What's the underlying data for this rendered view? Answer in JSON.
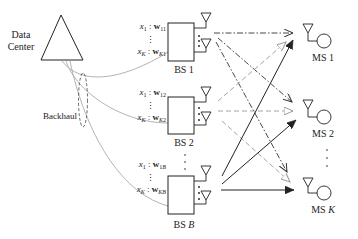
{
  "diagram": {
    "type": "system-model",
    "data_center": {
      "label_line1": "Data",
      "label_line2": "Center"
    },
    "backhaul_label": "Backhaul",
    "base_stations": [
      {
        "label": "BS 1",
        "label_prefix": "BS ",
        "label_index": "1",
        "first_stream": {
          "x": "x",
          "x_sub": "1",
          "w": "w",
          "w_sub": "11"
        },
        "last_stream": {
          "x": "x",
          "x_sub": "K",
          "w": "w",
          "w_sub": "K1"
        }
      },
      {
        "label": "BS 2",
        "label_prefix": "BS ",
        "label_index": "2",
        "first_stream": {
          "x": "x",
          "x_sub": "1",
          "w": "w",
          "w_sub": "12"
        },
        "last_stream": {
          "x": "x",
          "x_sub": "K",
          "w": "w",
          "w_sub": "K2"
        }
      },
      {
        "label": "BS B",
        "label_prefix": "BS ",
        "label_index": "B",
        "first_stream": {
          "x": "x",
          "x_sub": "1",
          "w": "w",
          "w_sub": "1B"
        },
        "last_stream": {
          "x": "x",
          "x_sub": "K",
          "w": "w",
          "w_sub": "KB"
        }
      }
    ],
    "mobile_stations": [
      {
        "label": "MS 1",
        "prefix": "MS ",
        "index": "1"
      },
      {
        "label": "MS 2",
        "prefix": "MS ",
        "index": "2"
      },
      {
        "label": "MS K",
        "prefix": "MS ",
        "index": "K"
      }
    ],
    "separator": ":",
    "vdots": "⋮",
    "link_styles": {
      "bs1": {
        "style": "dash-dot",
        "color": "#333333",
        "arrow": "open"
      },
      "bs2": {
        "style": "dashed",
        "color": "#999999",
        "arrow": "hollow-triangle"
      },
      "bsB": {
        "style": "solid",
        "color": "#222222",
        "arrow": "filled-triangle"
      }
    },
    "backhaul_color": "#aaaaaa"
  }
}
